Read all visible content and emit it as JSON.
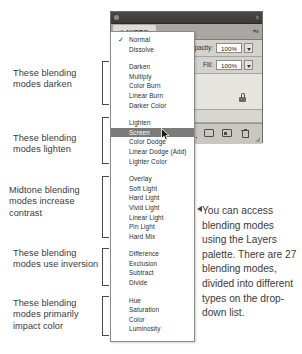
{
  "annotations": {
    "darken": "These blending modes darken",
    "lighten": "These blending modes lighten",
    "midtone": "Midtone blending modes increase contrast",
    "inversion": "These blending modes use inversion",
    "color": "These blending modes primarily impact color"
  },
  "panel": {
    "tab_label": "LAYERS",
    "tab_menu_glyph": "▾≡",
    "titlebar_menu_glyph": "≡",
    "opacity_label": "Opacity:",
    "opacity_value": "100%",
    "fill_label": "Fill:",
    "fill_value": "100%",
    "layer_name": "d copy",
    "toolbar_icons": [
      "fx-icon",
      "layer-mask-icon",
      "new-layer-icon",
      "trash-icon"
    ]
  },
  "dropdown": {
    "checked_item": "Normal",
    "selected_item": "Screen",
    "check_glyph": "✓",
    "groups": [
      {
        "name": "normal",
        "items": [
          "Normal",
          "Dissolve"
        ]
      },
      {
        "name": "darken",
        "items": [
          "Darken",
          "Multiply",
          "Color Burn",
          "Linear Burn",
          "Darker Color"
        ]
      },
      {
        "name": "lighten",
        "items": [
          "Lighten",
          "Screen",
          "Color Dodge",
          "Linear Dodge (Add)",
          "Lighter Color"
        ]
      },
      {
        "name": "contrast",
        "items": [
          "Overlay",
          "Soft Light",
          "Hard Light",
          "Vivid Light",
          "Linear Light",
          "Pin Light",
          "Hard Mix"
        ]
      },
      {
        "name": "inversion",
        "items": [
          "Difference",
          "Exclusion",
          "Subtract",
          "Divide"
        ]
      },
      {
        "name": "component",
        "items": [
          "Hue",
          "Saturation",
          "Color",
          "Luminosity"
        ]
      }
    ]
  },
  "caption": {
    "text": "You can access blending modes using the Layers palette. There are 27 blending modes, divided into different types on the drop-down list."
  },
  "colors": {
    "selection_bg": "#7d7b78",
    "panel_bg": "#d4d2cd",
    "titlebar": "#4b4947",
    "text": "#3b3b3b"
  }
}
